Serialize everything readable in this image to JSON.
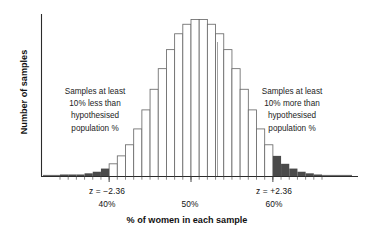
{
  "chart_data": {
    "type": "bar",
    "title": "",
    "xlabel": "% of women in each sample",
    "ylabel": "Number of samples",
    "grid": false,
    "legend": "none",
    "xlim": [
      34,
      66
    ],
    "ylim": [
      0,
      100
    ],
    "bin_width": 1,
    "categories": [
      "34",
      "35",
      "36",
      "37",
      "38",
      "39",
      "40",
      "41",
      "42",
      "43",
      "44",
      "45",
      "46",
      "47",
      "48",
      "49",
      "50",
      "51",
      "52",
      "53",
      "54",
      "55",
      "56",
      "57",
      "58",
      "59",
      "60",
      "61",
      "62",
      "63",
      "64",
      "65"
    ],
    "values": [
      1,
      1,
      1,
      2,
      3,
      5,
      8,
      13,
      20,
      30,
      42,
      55,
      68,
      80,
      90,
      96,
      99,
      99,
      96,
      90,
      80,
      68,
      55,
      42,
      30,
      20,
      13,
      8,
      5,
      3,
      2,
      1
    ],
    "shaded_tail_bins_left": [
      "34",
      "35",
      "36",
      "37",
      "38",
      "39"
    ],
    "shaded_tail_bins_right": [
      "60",
      "61",
      "62",
      "63",
      "64",
      "65"
    ],
    "tick_labels": {
      "left": {
        "z": "z = −2.36",
        "pct": "40%"
      },
      "middle": {
        "z": "",
        "pct": "50%"
      },
      "right": {
        "z": "z = +2.36",
        "pct": "60%"
      }
    },
    "annotations": [
      {
        "position": "left",
        "lines": [
          "Samples at least",
          "10% less than",
          "hypothesised",
          "population %"
        ]
      },
      {
        "position": "right",
        "lines": [
          "Samples at least",
          "10% more than",
          "hypothesised",
          "population %"
        ]
      }
    ]
  },
  "axes": {
    "y_title": "Number of samples",
    "x_title": "% of women in each sample"
  },
  "labels": {
    "z_left": "z = −2.36",
    "z_right": "z = +2.36",
    "pct_left": "40%",
    "pct_mid": "50%",
    "pct_right": "60%"
  },
  "annotation_left": {
    "line1": "Samples at least",
    "line2": "10% less than",
    "line3": "hypothesised",
    "line4": "population %"
  },
  "annotation_right": {
    "line1": "Samples at least",
    "line2": "10% more than",
    "line3": "hypothesised",
    "line4": "population %"
  },
  "colors": {
    "bar_stroke": "#6b6b6b",
    "bar_fill": "#ffffff",
    "tail_fill": "#4a4a4a",
    "axis": "#2b2b2b",
    "text": "#141414"
  }
}
